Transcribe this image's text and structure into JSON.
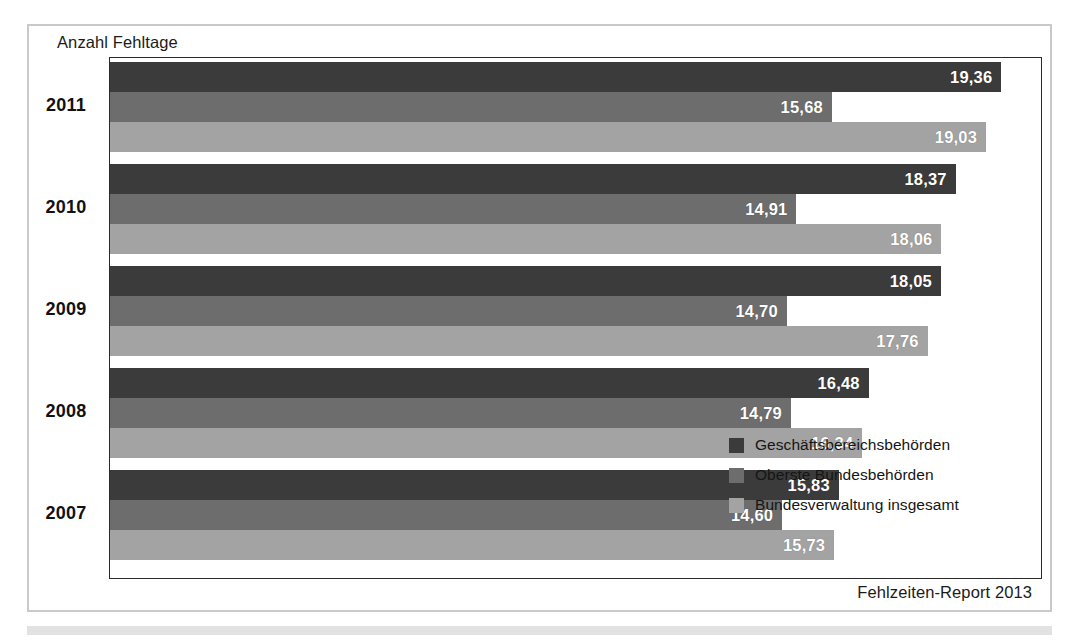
{
  "figure": {
    "axis_caption": "Anzahl Fehltage",
    "footer_note": "Fehlzeiten-Report 2013"
  },
  "legend": {
    "items": [
      {
        "label": "Geschäftsbereichsbehörden",
        "color": "#3b3b3b"
      },
      {
        "label": "Oberste Bundesbehörden",
        "color": "#6d6d6d"
      },
      {
        "label": "Bundesverwaltung insgesamt",
        "color": "#a3a3a3"
      }
    ]
  },
  "chart_data": {
    "type": "bar",
    "orientation": "horizontal",
    "title": "",
    "xlabel": "Anzahl Fehltage",
    "ylabel": "",
    "categories": [
      "2011",
      "2010",
      "2009",
      "2008",
      "2007"
    ],
    "xlim": [
      0,
      20.2
    ],
    "grid": false,
    "legend_position": "inside-bottom-right",
    "value_format": "comma-decimal",
    "series": [
      {
        "name": "Geschäftsbereichsbehörden",
        "color": "#3b3b3b",
        "values": [
          19.36,
          18.37,
          18.05,
          16.48,
          15.83
        ],
        "labels": [
          "19,36",
          "18,37",
          "18,05",
          "16,48",
          "15,83"
        ]
      },
      {
        "name": "Oberste Bundesbehörden",
        "color": "#6d6d6d",
        "values": [
          15.68,
          14.91,
          14.7,
          14.79,
          14.6
        ],
        "labels": [
          "15,68",
          "14,91",
          "14,70",
          "14,79",
          "14,60"
        ]
      },
      {
        "name": "Bundesverwaltung insgesamt",
        "color": "#a3a3a3",
        "values": [
          19.03,
          18.06,
          17.76,
          16.34,
          15.73
        ],
        "labels": [
          "19,03",
          "18,06",
          "17,76",
          "16,34",
          "15,73"
        ]
      }
    ]
  }
}
